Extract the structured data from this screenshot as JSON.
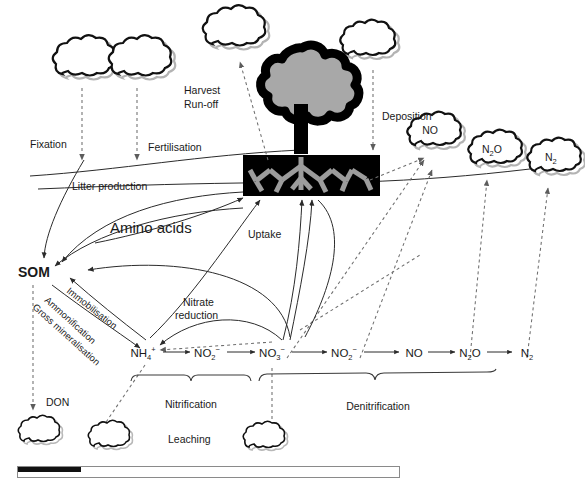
{
  "figure": {
    "type": "diagram"
  },
  "process_labels": {
    "fixation": "Fixation",
    "fertilisation": "Fertilisation",
    "harvest_runoff_line1": "Harvest",
    "harvest_runoff_line2": "Run-off",
    "deposition": "Deposition",
    "litter_production": "Litter production",
    "amino_acids": "Amino acids",
    "uptake": "Uptake",
    "nitrate_reduction_line1": "Nitrate",
    "nitrate_reduction_line2": "reduction",
    "immobilisation": "Immobilisation",
    "ammonification": "Ammonification",
    "gross_mineralisation": "Gross mineralisation",
    "nitrification": "Nitrification",
    "denitrification": "Denitrification",
    "leaching": "Leaching",
    "don": "DON"
  },
  "pools": {
    "som": "SOM"
  },
  "gas_clouds": [
    {
      "name": "no-cloud",
      "label": "NO",
      "sub": ""
    },
    {
      "name": "n2o-cloud",
      "label": "N",
      "sub": "2",
      "tail": "O"
    },
    {
      "name": "n2-cloud",
      "label": "N",
      "sub": "2",
      "tail": ""
    }
  ],
  "chain": {
    "caption": "Soil nitrogen transformation chain",
    "species": [
      {
        "id": "nh4",
        "base": "NH",
        "sub": "4",
        "sup": "+",
        "x": 143
      },
      {
        "id": "no2a",
        "base": "NO",
        "sub": "2",
        "sup": "−",
        "x": 207
      },
      {
        "id": "no3",
        "base": "NO",
        "sub": "3",
        "sup": "−",
        "x": 272
      },
      {
        "id": "no2b",
        "base": "NO",
        "sub": "2",
        "sup": "−",
        "x": 344
      },
      {
        "id": "no",
        "base": "NO",
        "sub": "",
        "sup": "",
        "x": 414
      },
      {
        "id": "n2o",
        "base": "N",
        "sub": "2",
        "sup": "",
        "tail": "O",
        "x": 470
      },
      {
        "id": "n2",
        "base": "N",
        "sub": "2",
        "sup": "",
        "x": 527
      }
    ]
  },
  "colors": {
    "ink": "#1a1a1a",
    "solid_line": "#2b2b2b",
    "dashed_line": "#6f6f6f",
    "tree_crown_fill": "#a8a8a8",
    "tree_outline": "#000000",
    "soil_block": "#000000",
    "root": "#9c9c9c",
    "cloud_fill": "#ffffff",
    "cloud_shadow": "#b3b3b3"
  },
  "scrollbar": {
    "name": "horizontal-scrollbar",
    "fill_percent": 16,
    "track_left": 17,
    "track_right": 400
  }
}
